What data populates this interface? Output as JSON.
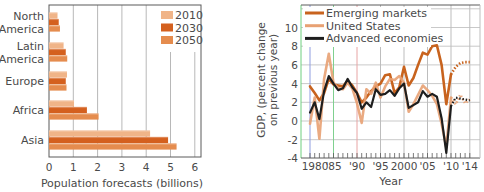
{
  "chart_data": [
    {
      "type": "bar",
      "orientation": "horizontal",
      "title": "",
      "xlabel": "Population forecasts (billions)",
      "ylabel": "",
      "xlim": [
        0,
        6
      ],
      "x_ticks": [
        "0",
        "1",
        "2",
        "3",
        "4",
        "5",
        "6"
      ],
      "grid": "vertical",
      "legend_position": "top-right",
      "categories": [
        "North America",
        "Latin America",
        "Europe",
        "Africa",
        "Asia"
      ],
      "category_lines": [
        [
          "North",
          "America"
        ],
        [
          "Latin",
          "America"
        ],
        [
          "Europe"
        ],
        [
          "Africa"
        ],
        [
          "Asia"
        ]
      ],
      "series": [
        {
          "name": "2010",
          "color": "#f0b488",
          "values": [
            0.35,
            0.6,
            0.74,
            1.03,
            4.16
          ]
        },
        {
          "name": "2030",
          "color": "#d4601e",
          "values": [
            0.4,
            0.69,
            0.69,
            1.56,
            4.9
          ]
        },
        {
          "name": "2050",
          "color": "#e58c4e",
          "values": [
            0.45,
            0.75,
            0.72,
            2.04,
            5.25
          ]
        }
      ]
    },
    {
      "type": "line",
      "title": "",
      "xlabel": "Year",
      "ylabel": "GDP, (percent change on previous year)",
      "ylabel_lines": [
        "GDP, (percent change",
        "on previous year)"
      ],
      "xlim": [
        1978,
        2015
      ],
      "ylim": [
        -4,
        12
      ],
      "y_ticks": [
        "-4",
        "-2",
        "0",
        "2",
        "4",
        "6",
        "8",
        "10"
      ],
      "x_ticks": [
        "1980",
        "'85",
        "'90",
        "'95",
        "2000",
        "'05",
        "'10",
        "'14"
      ],
      "grid": "both",
      "legend_position": "top-left",
      "note": "Values after 2010 are forecasts (dotted)",
      "x": [
        1980,
        1981,
        1982,
        1983,
        1984,
        1985,
        1986,
        1987,
        1988,
        1989,
        1990,
        1991,
        1992,
        1993,
        1994,
        1995,
        1996,
        1997,
        1998,
        1999,
        2000,
        2001,
        2002,
        2003,
        2004,
        2005,
        2006,
        2007,
        2008,
        2009,
        2010,
        2011,
        2012,
        2013,
        2014
      ],
      "series": [
        {
          "name": "Emerging markets",
          "color": "#c8631e",
          "forecast_from": 2010,
          "values": [
            3.7,
            3.0,
            2.2,
            3.0,
            4.5,
            3.9,
            3.8,
            3.7,
            4.3,
            3.8,
            3.0,
            2.0,
            2.5,
            3.2,
            3.7,
            4.0,
            4.9,
            5.0,
            3.0,
            3.6,
            5.8,
            3.8,
            4.6,
            6.0,
            7.3,
            7.1,
            8.0,
            8.1,
            6.0,
            1.8,
            5.0,
            5.8,
            6.2,
            6.3,
            6.3
          ]
        },
        {
          "name": "United States",
          "color": "#e8a173",
          "forecast_from": 2010,
          "values": [
            -0.3,
            2.5,
            -1.9,
            4.5,
            7.2,
            4.1,
            3.5,
            3.4,
            4.1,
            3.5,
            1.9,
            -0.2,
            3.4,
            2.9,
            4.1,
            2.5,
            3.7,
            4.5,
            4.4,
            4.8,
            4.1,
            1.0,
            1.8,
            2.8,
            3.8,
            3.3,
            2.7,
            1.8,
            -0.3,
            -2.8,
            2.5,
            1.8,
            2.8,
            1.9,
            2.3
          ]
        },
        {
          "name": "Advanced economies",
          "color": "#1e1e1e",
          "forecast_from": 2010,
          "values": [
            0.9,
            2.0,
            0.2,
            3.2,
            4.8,
            4.0,
            3.3,
            3.5,
            4.5,
            3.6,
            3.0,
            1.3,
            2.0,
            1.5,
            3.4,
            2.8,
            2.9,
            3.3,
            2.7,
            3.5,
            4.0,
            1.4,
            1.7,
            2.0,
            3.2,
            2.6,
            2.9,
            2.6,
            0.3,
            -3.4,
            1.6,
            2.5,
            2.4,
            2.3,
            2.2
          ]
        }
      ]
    }
  ]
}
